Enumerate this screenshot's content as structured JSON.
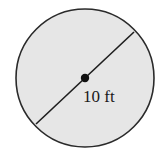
{
  "diagram": {
    "shape": "circle",
    "fill_color": "#e6e6e6",
    "stroke_color": "#2a2a2a",
    "center_dot": true,
    "segment": "diameter",
    "label": "10 ft"
  }
}
